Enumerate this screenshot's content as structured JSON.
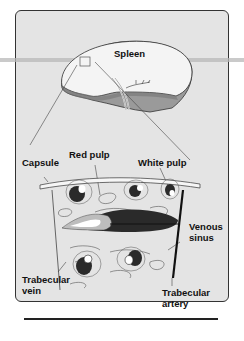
{
  "diagram": {
    "title": "Spleen",
    "labels": {
      "spleen": "Spleen",
      "capsule": "Capsule",
      "red_pulp": "Red pulp",
      "white_pulp": "White pulp",
      "venous_sinus": "Venous sinus",
      "venous_line1": "Venous",
      "venous_line2": "sinus",
      "trabecular_vein_line1": "Trabecular",
      "trabecular_vein_line2": "vein",
      "trabecular_artery_line1": "Trabecular",
      "trabecular_artery_line2": "artery"
    },
    "colors": {
      "background": "#e4e4e4",
      "organ_surface": "#f4f4f4",
      "organ_cut": "#9a9a9a",
      "dark_vessel": "#2a2a2a",
      "outline": "#333333"
    }
  }
}
